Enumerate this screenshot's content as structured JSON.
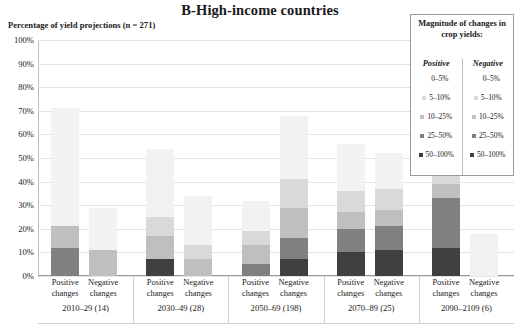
{
  "title": "B-High-income countries",
  "axis_title": "Percentage of yield projections (n = 271)",
  "yticks": [
    "100%",
    "90%",
    "80%",
    "70%",
    "60%",
    "50%",
    "40%",
    "30%",
    "20%",
    "10%",
    "0%"
  ],
  "legend": {
    "title": "Magnitude of changes in crop yields:",
    "col_positive": "Positive",
    "col_negative": "Negative",
    "rows": [
      "0–5%",
      "5–10%",
      "10–25%",
      "25–50%",
      "50–100%"
    ],
    "positive_colors": [
      "#f2f2f2",
      "#d9d9d9",
      "#bfbfbf",
      "#808080",
      "#404040"
    ],
    "negative_colors": [
      "#f2f2f2",
      "#d9d9d9",
      "#bfbfbf",
      "#808080",
      "#404040"
    ]
  },
  "groups": [
    {
      "period": "2010–29 (14)",
      "bars": [
        {
          "label": "Positive changes"
        },
        {
          "label": "Negative changes"
        }
      ]
    },
    {
      "period": "2030–49 (28)",
      "bars": [
        {
          "label": "Positive changes"
        },
        {
          "label": "Negative changes"
        }
      ]
    },
    {
      "period": "2050–69 (198)",
      "bars": [
        {
          "label": "Positive changes"
        },
        {
          "label": "Negative changes"
        }
      ]
    },
    {
      "period": "2070–89 (25)",
      "bars": [
        {
          "label": "Positive changes"
        },
        {
          "label": "Negative changes"
        }
      ]
    },
    {
      "period": "2090–2109 (6)",
      "bars": [
        {
          "label": "Positive changes"
        },
        {
          "label": "Negative changes"
        }
      ]
    }
  ],
  "chart_data": {
    "type": "bar",
    "title": "B-High-income countries",
    "subtitle": "",
    "xlabel": "",
    "ylabel": "Percentage of yield projections (n = 271)",
    "ylim": [
      0,
      100
    ],
    "ytick_values": [
      0,
      10,
      20,
      30,
      40,
      50,
      60,
      70,
      80,
      90,
      100
    ],
    "grid": true,
    "stacked": true,
    "legend_position": "top-right",
    "legend_title": "Magnitude of changes in crop yields:",
    "categories": [
      "2010–29 (14) Positive changes",
      "2010–29 (14) Negative changes",
      "2030–49 (28) Positive changes",
      "2030–49 (28) Negative changes",
      "2050–69 (198) Positive changes",
      "2050–69 (198) Negative changes",
      "2070–89 (25) Positive changes",
      "2070–89 (25) Negative changes",
      "2090–2109 (6) Positive changes",
      "2090–2109 (6) Negative changes"
    ],
    "series": [
      {
        "name": "0–5%",
        "color": "#f2f2f2",
        "values": [
          50,
          18,
          29,
          21,
          13,
          27,
          20,
          15,
          32,
          18
        ]
      },
      {
        "name": "5–10%",
        "color": "#d9d9d9",
        "values": [
          0,
          0,
          8,
          6,
          6,
          12,
          9,
          9,
          12,
          0
        ]
      },
      {
        "name": "10–25%",
        "color": "#bfbfbf",
        "values": [
          9,
          11,
          10,
          7,
          8,
          13,
          7,
          7,
          6,
          0
        ]
      },
      {
        "name": "25–50%",
        "color": "#808080",
        "values": [
          12,
          0,
          0,
          0,
          5,
          9,
          10,
          10,
          21,
          0
        ]
      },
      {
        "name": "50–100%",
        "color": "#404040",
        "values": [
          0,
          0,
          7,
          0,
          0,
          7,
          10,
          11,
          12,
          0
        ]
      }
    ],
    "totals": [
      71,
      29,
      54,
      34,
      32,
      68,
      56,
      52,
      83,
      18
    ]
  }
}
